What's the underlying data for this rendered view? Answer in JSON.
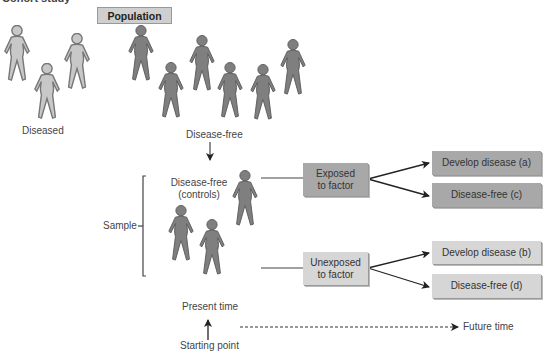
{
  "title": "Cohort study",
  "population_label": "Population",
  "groups": {
    "diseased_label": "Diseased",
    "disease_free_label": "Disease-free",
    "controls_label_line1": "Disease-free",
    "controls_label_line2": "(controls)",
    "sample_label": "Sample"
  },
  "exposure": {
    "exposed_line1": "Exposed",
    "exposed_line2": "to factor",
    "unexposed_line1": "Unexposed",
    "unexposed_line2": "to factor"
  },
  "outcomes": {
    "a": "Develop disease (a)",
    "c": "Disease-free (c)",
    "b": "Develop disease (b)",
    "d": "Disease-free (d)"
  },
  "timeline": {
    "present_label": "Present time",
    "start_label": "Starting point",
    "future_label": "Future time"
  },
  "colors": {
    "diseased_figure": "#c8c8c8",
    "healthy_figure": "#7f7f7f",
    "exposed_box": "#a8a8a8",
    "unexposed_box": "#d6d6d6"
  }
}
